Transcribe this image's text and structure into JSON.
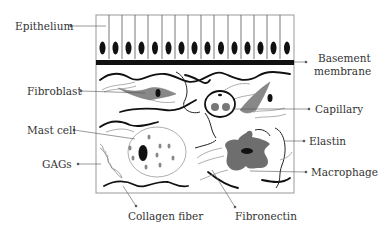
{
  "labels": {
    "epithelium": "Epithelium",
    "basement_membrane_line1": "Basement",
    "basement_membrane_line2": "membrane",
    "fibroblast": "Fibroblast",
    "capillary": "Capillary",
    "mast_cell": "Mast cell",
    "elastin": "Elastin",
    "gags": "GAGs",
    "macrophage": "Macrophage",
    "collagen_fiber": "Collagen fiber",
    "fibronectin": "Fibronectin"
  },
  "colors": {
    "outline": "#000000",
    "cell_gray": "#8a8a8a",
    "macrophage_gray": "#6e6e6e",
    "fiber_light": "#9a9a9a",
    "box_border": "#9a9a9a",
    "text": "#333333"
  },
  "epithelium_cell_count": 15
}
